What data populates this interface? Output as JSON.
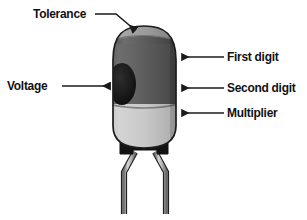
{
  "diagram": {
    "background_color": "#ffffff",
    "labels": {
      "tolerance": "Tolerance",
      "voltage": "Voltage",
      "first_digit": "First digit",
      "second_digit": "Second digit",
      "multiplier": "Multiplier"
    },
    "component": {
      "body_colors": {
        "tolerance_band": "#9a9a9a",
        "first_digit_band": "#5d5d5d",
        "second_digit_band": "#5d5d5d",
        "multiplier_band": "#c9c9c9",
        "voltage_spot": "#1c1c1c",
        "base": "#111111",
        "lead": "#b3b3b3",
        "outline": "#1a1a1a"
      }
    },
    "callouts": [
      {
        "id": "tolerance",
        "label": "Tolerance",
        "arrow_direction": "down-right",
        "target": "top-dome-band"
      },
      {
        "id": "voltage",
        "label": "Voltage",
        "arrow_direction": "right",
        "target": "voltage-spot"
      },
      {
        "id": "first-digit",
        "label": "First digit",
        "arrow_direction": "left",
        "target": "upper-body-band"
      },
      {
        "id": "second-digit",
        "label": "Second digit",
        "arrow_direction": "left",
        "target": "middle-body-band"
      },
      {
        "id": "multiplier",
        "label": "Multiplier",
        "arrow_direction": "left",
        "target": "lower-body-band"
      }
    ]
  }
}
